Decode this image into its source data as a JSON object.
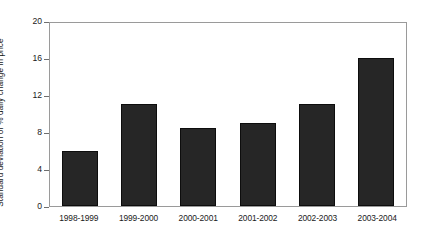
{
  "chart_data": {
    "type": "bar",
    "title": "",
    "xlabel": "",
    "ylabel": "Standard deviation of % daily change in price",
    "categories": [
      "1998-1999",
      "1999-2000",
      "2000-2001",
      "2001-2002",
      "2002-2003",
      "2003-2004"
    ],
    "values": [
      6.0,
      11.0,
      8.4,
      9.0,
      11.0,
      16.0
    ],
    "ylim": [
      0,
      20
    ],
    "yticks": [
      0,
      4,
      8,
      12,
      16,
      20
    ],
    "ytick_labels": [
      "0",
      "4",
      "8",
      "12",
      "16",
      "20"
    ],
    "grid": false,
    "legend": "none",
    "bar_color": "#262626",
    "frame_color": "#9a9a9a",
    "background_color": "#ffffff"
  }
}
